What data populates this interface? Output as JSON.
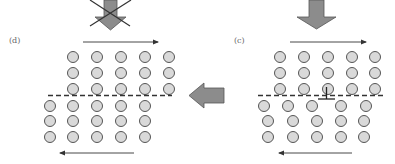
{
  "figure": {
    "colors": {
      "atom_fill": "#d9d9d9",
      "atom_stroke": "#555555",
      "block_arrow_fill": "#8c8c8c",
      "block_arrow_stroke": "#555555",
      "line": "#333333",
      "cross": "#333333"
    }
  },
  "panels": {
    "left": {
      "label": "(d)",
      "load_arrow": {
        "direction": "down",
        "crossed_out": true
      },
      "top_shear_arrow": {
        "direction": "right"
      },
      "bottom_shear_arrow": {
        "direction": "left"
      },
      "slip_plane": {
        "style": "dashed"
      },
      "upper_rows": 3,
      "lower_rows": 3,
      "atoms_per_row": 5,
      "dislocation": "none (slipped out, step formed)"
    },
    "right": {
      "label": "(c)",
      "load_arrow": {
        "direction": "down",
        "crossed_out": false
      },
      "top_shear_arrow": {
        "direction": "right"
      },
      "bottom_shear_arrow": {
        "direction": "left"
      },
      "slip_plane": {
        "style": "dashed"
      },
      "upper_rows": 3,
      "lower_rows": 3,
      "atoms_per_row": 5,
      "dislocation": "edge dislocation symbol on slip plane"
    }
  },
  "transition_arrow": {
    "direction": "left",
    "from": "(c)",
    "to": "(d)"
  }
}
